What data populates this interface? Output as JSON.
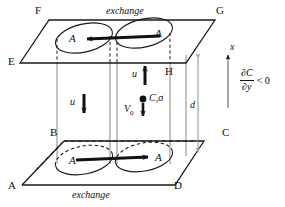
{
  "figure": {
    "type": "3d-schematic",
    "colors": {
      "line": "#1a1a1a",
      "cylinder": "#8c8c8c",
      "dimension": "#9a9a9a",
      "background": "#ffffff"
    }
  },
  "vertices": {
    "top_plane": [
      {
        "id": "F",
        "label": "F",
        "x": 37,
        "y": 11
      },
      {
        "id": "G",
        "label": "G",
        "x": 218,
        "y": 11
      },
      {
        "id": "E",
        "label": "E",
        "x": 10,
        "y": 62
      },
      {
        "id": "H",
        "label": "H",
        "x": 166,
        "y": 72
      }
    ],
    "bottom_plane": [
      {
        "id": "B",
        "label": "B",
        "x": 52,
        "y": 133
      },
      {
        "id": "C",
        "label": "C",
        "x": 224,
        "y": 133
      },
      {
        "id": "A",
        "label": "A",
        "x": 9,
        "y": 186
      },
      {
        "id": "D",
        "label": "D",
        "x": 175,
        "y": 186
      }
    ]
  },
  "labels": {
    "exchange_top": "exchange",
    "exchange_bottom": "exchange",
    "cell_area_top_left": "A",
    "cell_area_top_right": "A",
    "cell_area_bottom_left": "A",
    "cell_area_bottom_right": "A",
    "velocity_left": "u",
    "velocity_right": "u",
    "settling_velocity": "V",
    "settling_velocity_sub": "0",
    "concentration": "C,σ",
    "axis_x": "x",
    "gap_distance": "d"
  },
  "gradient": {
    "numerator": "∂C",
    "denominator": "∂y",
    "comparison": "< 0"
  },
  "flow_arrows": [
    {
      "name": "top-left-exchange-arrow",
      "direction": "left",
      "plane": "top"
    },
    {
      "name": "bottom-exchange-arrow",
      "direction": "right",
      "plane": "bottom"
    },
    {
      "name": "left-downflow-arrow",
      "direction": "down",
      "label": "u"
    },
    {
      "name": "right-upflow-arrow",
      "direction": "up",
      "label": "u"
    },
    {
      "name": "settling-arrow",
      "direction": "down",
      "label": "V0"
    }
  ]
}
